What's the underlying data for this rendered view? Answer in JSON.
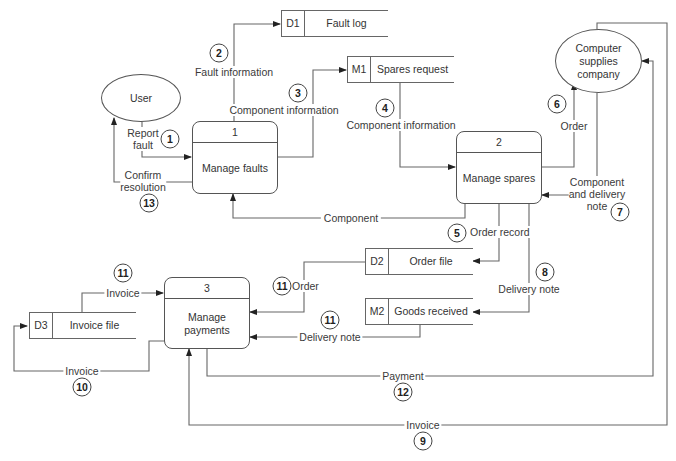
{
  "diagram": {
    "type": "data-flow-diagram",
    "external_entities": [
      {
        "id": "user",
        "label": "User"
      },
      {
        "id": "csc",
        "label": "Computer supplies company"
      }
    ],
    "processes": [
      {
        "number": "1",
        "label": "Manage faults"
      },
      {
        "number": "2",
        "label": "Manage spares"
      },
      {
        "number": "3",
        "label": "Manage payments"
      }
    ],
    "data_stores": [
      {
        "id": "D1",
        "label": "Fault log"
      },
      {
        "id": "M1",
        "label": "Spares request"
      },
      {
        "id": "D2",
        "label": "Order file"
      },
      {
        "id": "M2",
        "label": "Goods received"
      },
      {
        "id": "D3",
        "label": "Invoice file"
      }
    ],
    "flows": [
      {
        "step": "1",
        "label": "Report fault",
        "from": "User",
        "to": "Manage faults"
      },
      {
        "step": "2",
        "label": "Fault information",
        "from": "Manage faults",
        "to": "Fault log"
      },
      {
        "step": "3",
        "label": "Component information",
        "from": "Manage faults",
        "to": "Spares request"
      },
      {
        "step": "4",
        "label": "Component information",
        "from": "Spares request",
        "to": "Manage spares"
      },
      {
        "step": "5",
        "label": "Order record",
        "from": "Manage spares",
        "to": "Order file"
      },
      {
        "step": "6",
        "label": "Order",
        "from": "Manage spares",
        "to": "Computer supplies company"
      },
      {
        "step": "7",
        "label": "Component and delivery note",
        "from": "Computer supplies company",
        "to": "Manage spares"
      },
      {
        "step": "8",
        "label": "Delivery note",
        "from": "Manage spares",
        "to": "Goods received"
      },
      {
        "step": "9",
        "label": "Invoice",
        "from": "Computer supplies company",
        "to": "Manage payments"
      },
      {
        "step": "10",
        "label": "Invoice",
        "from": "Manage payments",
        "to": "Invoice file"
      },
      {
        "step": "11",
        "label": "Invoice",
        "from": "Invoice file",
        "to": "Manage payments"
      },
      {
        "step": "11",
        "label": "Order",
        "from": "Order file",
        "to": "Manage payments"
      },
      {
        "step": "11",
        "label": "Delivery note",
        "from": "Goods received",
        "to": "Manage payments"
      },
      {
        "step": "12",
        "label": "Payment",
        "from": "Manage payments",
        "to": "Computer supplies company"
      },
      {
        "step": "13",
        "label": "Confirm resolution",
        "from": "Manage faults",
        "to": "User"
      },
      {
        "step": "",
        "label": "Component",
        "from": "Manage spares",
        "to": "Manage faults"
      }
    ]
  },
  "labels": {
    "report_fault_1": "Report",
    "report_fault_2": "fault",
    "confirm_1": "Confirm",
    "confirm_2": "resolution",
    "component_info_7_1": "Component",
    "component_info_7_2": "and delivery",
    "component_info_7_3": "note",
    "csc_1": "Computer",
    "csc_2": "supplies",
    "csc_3": "company",
    "mp_1": "Manage",
    "mp_2": "payments"
  }
}
